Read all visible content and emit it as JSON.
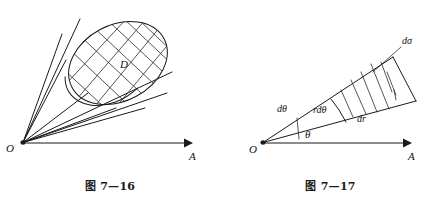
{
  "page": {
    "background_color": "#ffffff",
    "ink_color": "#1a1a1a",
    "width": 441,
    "height": 199
  },
  "figures": [
    {
      "id": "fig-7-16",
      "caption": "图 7—16",
      "description": "solid-angle-cone-over-surface-D",
      "labels": {
        "origin": "O",
        "axis": "A",
        "region": "D"
      },
      "geometry": {
        "apex": [
          22,
          143
        ],
        "axis_end": [
          190,
          143
        ],
        "ellipse_center": [
          118,
          63
        ],
        "ellipse_rx": 52,
        "ellipse_ry": 38,
        "ellipse_rotation_deg": -28,
        "ray_count": 7,
        "grid_lines_u": 6,
        "grid_lines_v": 6
      }
    },
    {
      "id": "fig-7-17",
      "caption": "图 7—17",
      "description": "polar-area-element-r-dtheta-dr",
      "labels": {
        "origin": "O",
        "axis": "A",
        "angle": "θ",
        "angle_increment": "dθ",
        "arc_element": "rdθ",
        "radial_element": "dr",
        "area_element": "dσ"
      },
      "geometry": {
        "apex": [
          42,
          143
        ],
        "axis_end": [
          192,
          143
        ],
        "theta_deg": 27,
        "dtheta_deg": 13,
        "inner_radius": 118,
        "outer_radius": 172,
        "hatch_count": 5
      }
    }
  ]
}
